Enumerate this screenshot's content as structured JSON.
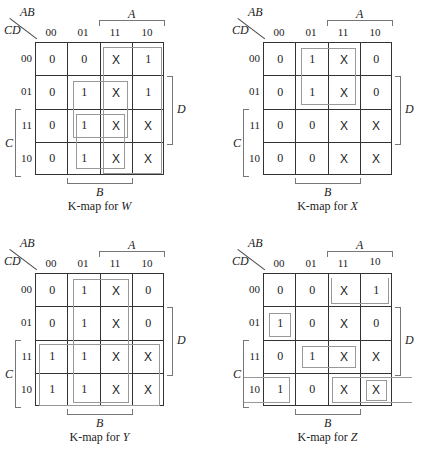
{
  "axes": {
    "row_var": "CD",
    "col_var": "AB",
    "col_labels": [
      "00",
      "01",
      "11",
      "10"
    ],
    "row_labels": [
      "00",
      "01",
      "11",
      "10"
    ],
    "a_label": "A",
    "b_label": "B",
    "c_label": "C",
    "d_label": "D"
  },
  "maps": [
    {
      "id": "W",
      "caption_prefix": "K-map for ",
      "caption_var": "W",
      "cells": [
        [
          "0",
          "0",
          "X",
          "1"
        ],
        [
          "0",
          "1",
          "X",
          "1"
        ],
        [
          "0",
          "1",
          "X",
          "X"
        ],
        [
          "0",
          "1",
          "X",
          "X"
        ]
      ],
      "groups": [
        "A (cols 11,10 all rows)",
        "BD (rows 01,11 cols 01,11)",
        "BC (rows 11,10 cols 01,11)"
      ]
    },
    {
      "id": "X",
      "caption_prefix": "K-map for ",
      "caption_var": "X",
      "cells": [
        [
          "0",
          "1",
          "X",
          "0"
        ],
        [
          "0",
          "1",
          "X",
          "0"
        ],
        [
          "0",
          "0",
          "X",
          "X"
        ],
        [
          "0",
          "0",
          "X",
          "X"
        ]
      ],
      "groups": [
        "BC' (rows 00,01 cols 01,11)"
      ]
    },
    {
      "id": "Y",
      "caption_prefix": "K-map for ",
      "caption_var": "Y",
      "cells": [
        [
          "0",
          "1",
          "X",
          "0"
        ],
        [
          "0",
          "1",
          "X",
          "0"
        ],
        [
          "1",
          "1",
          "X",
          "X"
        ],
        [
          "1",
          "1",
          "X",
          "X"
        ]
      ],
      "groups": [
        "B (cols 01,11 all rows)",
        "C (rows 11,10 all cols)"
      ]
    },
    {
      "id": "Z",
      "caption_prefix": "K-map for ",
      "caption_var": "Z",
      "cells": [
        [
          "0",
          "0",
          "X",
          "1"
        ],
        [
          "1",
          "0",
          "X",
          "0"
        ],
        [
          "0",
          "1",
          "X",
          "X"
        ],
        [
          "1",
          "0",
          "X",
          "X"
        ]
      ],
      "groups": [
        "AC'D' (row 00 cols 11,10)",
        "A'B'C'D (single)",
        "BCD (row 11 cols 01,11)",
        "CD' wrap (row 10 cols 00 & 11,10)"
      ]
    }
  ]
}
